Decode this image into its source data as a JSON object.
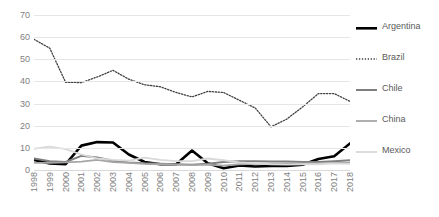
{
  "chart_data": {
    "type": "line",
    "title": "",
    "xlabel": "",
    "ylabel": "",
    "ylim": [
      0,
      70
    ],
    "yticks": [
      0,
      10,
      20,
      30,
      40,
      50,
      60,
      70
    ],
    "grid": true,
    "legend_position": "right",
    "categories": [
      "1998",
      "1999",
      "2000",
      "2001",
      "2002",
      "2003",
      "2004",
      "2005",
      "2006",
      "2007",
      "2008",
      "2009",
      "2010",
      "2011",
      "2012",
      "2013",
      "2014",
      "2015",
      "2016",
      "2017",
      "2018"
    ],
    "series": [
      {
        "name": "Argentina",
        "color": "#000000",
        "style": "solid",
        "width": 2.6,
        "values": [
          4.6,
          3.0,
          2.6,
          11.0,
          12.6,
          12.4,
          7.0,
          3.6,
          2.6,
          2.6,
          8.8,
          3.0,
          0.8,
          2.0,
          1.6,
          1.8,
          1.8,
          2.4,
          5.0,
          6.2,
          12.0
        ]
      },
      {
        "name": "Brazil",
        "color": "#404040",
        "style": "dotted",
        "width": 1.3,
        "values": [
          59.0,
          55.0,
          39.6,
          39.5,
          42.0,
          45.0,
          41.0,
          38.5,
          37.6,
          35.0,
          33.0,
          35.5,
          35.0,
          31.5,
          28.0,
          19.5,
          23.0,
          28.5,
          34.5,
          34.5,
          31.0
        ]
      },
      {
        "name": "Chile",
        "color": "#7f7f7f",
        "style": "solid",
        "width": 2.0,
        "values": [
          5.2,
          4.0,
          3.6,
          6.4,
          5.6,
          4.2,
          3.4,
          3.0,
          2.8,
          2.6,
          2.4,
          2.8,
          3.6,
          4.0,
          4.0,
          3.8,
          3.8,
          3.6,
          3.6,
          4.0,
          4.4
        ]
      },
      {
        "name": "China",
        "color": "#a6a6a6",
        "style": "solid",
        "width": 1.8,
        "values": [
          3.2,
          3.2,
          3.4,
          3.8,
          4.6,
          3.6,
          3.2,
          2.8,
          2.6,
          2.4,
          2.2,
          2.4,
          2.0,
          2.6,
          2.8,
          2.8,
          3.0,
          3.0,
          3.0,
          3.2,
          3.2
        ]
      },
      {
        "name": "Mexico",
        "color": "#d9d9d9",
        "style": "solid",
        "width": 1.8,
        "values": [
          9.6,
          10.6,
          9.4,
          7.0,
          5.2,
          4.6,
          4.2,
          5.6,
          4.6,
          4.0,
          4.0,
          5.2,
          4.4,
          3.4,
          3.0,
          2.6,
          2.4,
          2.6,
          2.6,
          3.0,
          2.8
        ]
      }
    ]
  },
  "legend": {
    "items": [
      {
        "label": "Argentina"
      },
      {
        "label": "Brazil"
      },
      {
        "label": "Chile"
      },
      {
        "label": "China"
      },
      {
        "label": "Mexico"
      }
    ]
  },
  "colors": {
    "background": "#ffffff",
    "gridline": "#e6e6e6",
    "tick_text": "#808080",
    "legend_text": "#595959"
  }
}
